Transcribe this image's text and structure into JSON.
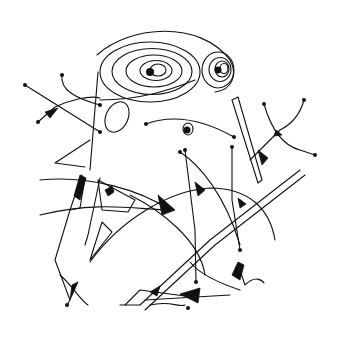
{
  "artwork": {
    "background": "#ffffff",
    "ink": "#111111",
    "width": 344,
    "height": 340,
    "spirals": [
      {
        "name": "large-spiral",
        "cx": 150,
        "cy": 72,
        "rings": [
          [
            50,
            30
          ],
          [
            40,
            23
          ],
          [
            28,
            16
          ],
          [
            16,
            10
          ],
          [
            8,
            6
          ]
        ],
        "dot": [
          150,
          72,
          4
        ]
      },
      {
        "name": "small-spiral",
        "cx": 218,
        "cy": 70,
        "rings": [
          [
            16,
            18
          ],
          [
            11,
            12
          ],
          [
            7,
            8
          ],
          [
            4,
            5
          ]
        ],
        "dot": [
          218,
          70,
          3.5
        ]
      }
    ],
    "lines": [
      "M97,55 C130,25 200,20 230,60 C238,75 232,90 215,92",
      "M100,100 C140,100 170,90 195,80",
      "M25,85 L100,132",
      "M38,122 L55,107 C70,100 90,95 100,98",
      "M62,75 C60,90 75,98 100,105",
      "M98,72 L90,170",
      "M90,140 L55,163 L85,167",
      "M146,124 C170,115 200,118 234,137",
      "M238,97 L262,180 L258,183 L232,100 Z",
      "M264,104 C270,125 280,145 300,150 L315,155",
      "M304,100 C300,115 290,125 280,130 L250,160",
      "M180,152 C200,165 225,195 240,245",
      "M185,150 L195,230 L196,282",
      "M232,147 L232,200 L240,250",
      "M40,180 C90,175 140,190 170,210",
      "M40,215 C100,200 140,210 170,210",
      "M82,175 L70,210 L80,208 L85,178",
      "M70,210 L55,260 L70,300 L67,305",
      "M100,178 L88,235 L85,245",
      "M98,180 L135,200 L128,212 L102,210 Z",
      "M102,222 L112,232 L90,260 Z",
      "M90,262 C120,220 170,190 210,188 C250,188 270,210 275,240",
      "M130,195 C160,210 200,240 205,275",
      "M60,275 C72,285 80,300 88,305",
      "M300,170 L210,240 L140,305 L120,305",
      "M305,175 L215,245 L145,310",
      "M240,270 L245,285 C255,275 262,280 264,283",
      "M145,300 L230,295",
      "M125,305 L140,290 L185,296",
      "M190,262 C200,275 225,285 240,290",
      "M150,305 C170,300 180,308 185,305"
    ],
    "wedges": [
      "M45,112 L58,108 L50,118 Z",
      "M80,175 L86,178 L80,200 L74,196 Z",
      "M105,190 L112,186 L114,192 L108,196 Z",
      "M158,195 L175,210 L162,215 Z",
      "M195,182 L205,190 L198,196 Z",
      "M258,150 L268,158 L262,165 Z",
      "M276,130 L282,135 L274,136 Z",
      "M238,198 L246,204 L240,208 Z",
      "M72,285 L78,282 L70,300 Z",
      "M150,292 L160,286 L157,296 Z",
      "M180,294 L200,288 L198,303 Z",
      "M238,262 L244,265 L240,280 L232,275 Z"
    ],
    "dots": [
      [
        25,
        85,
        2
      ],
      [
        62,
        75,
        2
      ],
      [
        38,
        122,
        2
      ],
      [
        100,
        132,
        2
      ],
      [
        100,
        105,
        2
      ],
      [
        146,
        124,
        2
      ],
      [
        234,
        137,
        2
      ],
      [
        264,
        104,
        2
      ],
      [
        304,
        100,
        2
      ],
      [
        315,
        155,
        2
      ],
      [
        180,
        152,
        2
      ],
      [
        185,
        150,
        2
      ],
      [
        232,
        147,
        2
      ],
      [
        196,
        282,
        2
      ],
      [
        240,
        250,
        2
      ],
      [
        67,
        305,
        2
      ],
      [
        237,
        268,
        2
      ],
      [
        188,
        308,
        2
      ]
    ],
    "ellipses": [
      {
        "name": "oval",
        "cx": 117,
        "cy": 117,
        "rx": 11,
        "ry": 16,
        "rot": 25
      },
      {
        "name": "eye",
        "cx": 188,
        "cy": 129,
        "rx": 5,
        "ry": 6,
        "rot": 0
      }
    ]
  }
}
